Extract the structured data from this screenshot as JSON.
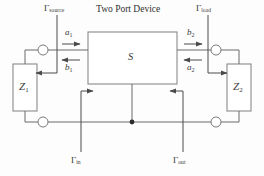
{
  "diagram": {
    "title": "Two Port Device",
    "type": "two-port-network-schematic",
    "center_block_label": "S",
    "labels": {
      "gamma_source": "Γ",
      "gamma_source_sub": "source",
      "gamma_load": "Γ",
      "gamma_load_sub": "load",
      "gamma_in": "Γ",
      "gamma_in_sub": "in",
      "gamma_out": "Γ",
      "gamma_out_sub": "out",
      "a1": "a",
      "a1_sub": "1",
      "b1": "b",
      "b1_sub": "1",
      "a2": "a",
      "a2_sub": "2",
      "b2": "b",
      "b2_sub": "2",
      "z1": "Z",
      "z1_sub": "1",
      "z2": "Z",
      "z2_sub": "2"
    },
    "colors": {
      "background": "#fdfdfd",
      "wire": "#6b6b6b",
      "box_border": "#8a8a8a",
      "text": "#3a3a3a",
      "junction": "#2b2b2b"
    }
  }
}
